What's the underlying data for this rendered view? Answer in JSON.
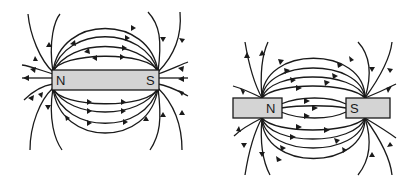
{
  "diagrams": [
    {
      "title": "Single bar magnet field lines",
      "magnet": {
        "north_label": "N",
        "south_label": "S"
      }
    },
    {
      "title": "Two magnets, opposite poles facing",
      "magnet_left": {
        "label": "N"
      },
      "magnet_right": {
        "label": "S"
      }
    }
  ],
  "colors": {
    "line": "#1a1a1a",
    "magnet_fill": "#d4d4d4",
    "background": "#ffffff"
  }
}
